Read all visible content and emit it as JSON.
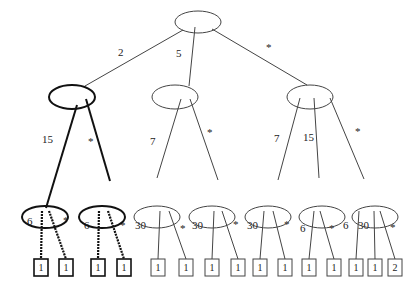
{
  "diagram": {
    "type": "tree",
    "root": {
      "id": "root",
      "x": 198,
      "y": 22,
      "rx": 23,
      "ry": 11,
      "bold": false
    },
    "level1": [
      {
        "id": "n1",
        "x": 72,
        "y": 97,
        "bold": true
      },
      {
        "id": "n2",
        "x": 175,
        "y": 97,
        "bold": false
      },
      {
        "id": "n3",
        "x": 310,
        "y": 97,
        "bold": false
      }
    ],
    "level2": [
      {
        "id": "n11",
        "parent": "n1",
        "x": 45,
        "y": 217,
        "bold": true
      },
      {
        "id": "n12",
        "parent": "n1",
        "x": 102,
        "y": 217,
        "bold": true
      },
      {
        "id": "n21",
        "parent": "n2",
        "x": 157,
        "y": 217,
        "bold": false
      },
      {
        "id": "n22",
        "parent": "n2",
        "x": 212,
        "y": 217,
        "bold": false
      },
      {
        "id": "n31",
        "parent": "n3",
        "x": 268,
        "y": 217,
        "bold": false
      },
      {
        "id": "n32",
        "parent": "n3",
        "x": 322,
        "y": 217,
        "bold": false
      },
      {
        "id": "n33",
        "parent": "n3",
        "x": 375,
        "y": 217,
        "bold": false
      }
    ],
    "edges_root": [
      {
        "to": "n1",
        "label": "2",
        "lx": 118,
        "ly": 56,
        "x1": 183,
        "y1": 30,
        "x2": 85,
        "y2": 86,
        "style": "normal"
      },
      {
        "to": "n2",
        "label": "5",
        "lx": 176,
        "ly": 57,
        "x1": 195,
        "y1": 27,
        "x2": 189,
        "y2": 86,
        "style": "normal"
      },
      {
        "to": "n3",
        "label": "*",
        "lx": 266,
        "ly": 51,
        "x1": 212,
        "y1": 29,
        "x2": 307,
        "y2": 85,
        "style": "normal"
      }
    ],
    "edges_level1": [
      {
        "to": "n11",
        "label": "15",
        "lx": 42,
        "ly": 143,
        "x1": 77,
        "y1": 105,
        "x2": 46,
        "y2": 208,
        "style": "bold"
      },
      {
        "to": "n12",
        "label": "*",
        "lx": 88,
        "ly": 145,
        "x1": 86,
        "y1": 99,
        "x2": 110,
        "y2": 181,
        "style": "bold"
      },
      {
        "to": "n21",
        "label": "7",
        "lx": 150,
        "ly": 145,
        "x1": 181,
        "y1": 99,
        "x2": 157,
        "y2": 178,
        "style": "normal"
      },
      {
        "to": "n22",
        "label": "*",
        "lx": 207,
        "ly": 136,
        "x1": 190,
        "y1": 99,
        "x2": 218,
        "y2": 180,
        "style": "normal"
      },
      {
        "to": "n31",
        "label": "7",
        "lx": 274,
        "ly": 142,
        "x1": 300,
        "y1": 98,
        "x2": 278,
        "y2": 180,
        "style": "normal"
      },
      {
        "to": "n32",
        "label": "15",
        "lx": 303,
        "ly": 141,
        "x1": 314,
        "y1": 98,
        "x2": 319,
        "y2": 178,
        "style": "normal"
      },
      {
        "to": "n33",
        "label": "*",
        "lx": 355,
        "ly": 135,
        "x1": 330,
        "y1": 98,
        "x2": 364,
        "y2": 179,
        "style": "normal"
      }
    ],
    "leaves": [
      {
        "parent": "n11",
        "value": "1",
        "x": 34,
        "label": "6",
        "lx": 27,
        "ly": 225,
        "side": "left",
        "style": "dotted",
        "ex": 42
      },
      {
        "parent": "n11",
        "value": "1",
        "x": 59,
        "label": "*",
        "lx": 63,
        "ly": 224,
        "side": "right",
        "style": "dotted",
        "ex": 49
      },
      {
        "parent": "n12",
        "value": "1",
        "x": 91,
        "label": "6",
        "lx": 84,
        "ly": 229,
        "side": "left",
        "style": "dotted",
        "ex": 99
      },
      {
        "parent": "n12",
        "value": "1",
        "x": 117,
        "label": "*",
        "lx": 120,
        "ly": 229,
        "side": "right",
        "style": "dotted",
        "ex": 108
      },
      {
        "parent": "n21",
        "value": "1",
        "x": 151,
        "label": "30",
        "lx": 135,
        "ly": 229,
        "side": "left",
        "style": "normal",
        "ex": 160
      },
      {
        "parent": "n21",
        "value": "1",
        "x": 179,
        "label": "*",
        "lx": 180,
        "ly": 232,
        "side": "right",
        "style": "normal",
        "ex": 169
      },
      {
        "parent": "n22",
        "value": "1",
        "x": 205,
        "label": "30",
        "lx": 192,
        "ly": 229,
        "side": "left",
        "style": "normal",
        "ex": 214
      },
      {
        "parent": "n22",
        "value": "1",
        "x": 231,
        "label": "*",
        "lx": 233,
        "ly": 228,
        "side": "right",
        "style": "normal",
        "ex": 222
      },
      {
        "parent": "n31",
        "value": "1",
        "x": 253,
        "label": "30",
        "lx": 247,
        "ly": 229,
        "side": "left",
        "style": "normal",
        "ex": 264
      },
      {
        "parent": "n31",
        "value": "1",
        "x": 278,
        "label": "*",
        "lx": 284,
        "ly": 228,
        "side": "right",
        "style": "normal",
        "ex": 273
      },
      {
        "parent": "n32",
        "value": "1",
        "x": 302,
        "label": "6",
        "lx": 300,
        "ly": 232,
        "side": "left",
        "style": "normal",
        "ex": 314
      },
      {
        "parent": "n32",
        "value": "1",
        "x": 327,
        "label": "*",
        "lx": 329,
        "ly": 232,
        "side": "right",
        "style": "normal",
        "ex": 320
      },
      {
        "parent": "n33",
        "value": "1",
        "x": 349,
        "label": "6",
        "lx": 343,
        "ly": 229,
        "side": "left",
        "style": "normal",
        "ex": 359
      },
      {
        "parent": "n33",
        "value": "1",
        "x": 368,
        "label": "30",
        "lx": 358,
        "ly": 229,
        "side": "left",
        "style": "normal",
        "ex": 374
      },
      {
        "parent": "n33",
        "value": "2",
        "x": 388,
        "label": "*",
        "lx": 390,
        "ly": 231,
        "side": "right",
        "style": "normal",
        "ex": 380
      }
    ],
    "leaf_box": {
      "w": 14,
      "h": 17,
      "y": 259
    }
  }
}
